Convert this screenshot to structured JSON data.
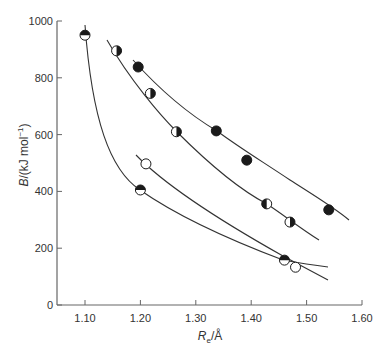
{
  "chart_data": {
    "type": "scatter",
    "title": "",
    "xlabel": "R_e/Å",
    "xlabel_main": "R",
    "xlabel_sub": "e",
    "xlabel_unit": "/Å",
    "ylabel": "B/(kJ mol⁻¹)",
    "ylabel_main": "B",
    "ylabel_unit": "/(kJ mol",
    "ylabel_sup": "−1",
    "ylabel_close": ")",
    "xlim": [
      1.05,
      1.6
    ],
    "ylim": [
      0,
      1000
    ],
    "xticks": [
      "1.10",
      "1.20",
      "1.30",
      "1.40",
      "1.50",
      "1.60"
    ],
    "yticks": [
      "0",
      "200",
      "400",
      "600",
      "800",
      "1000"
    ],
    "grid": false,
    "legend": null,
    "series": [
      {
        "name": "curve-a-steep",
        "points": [
          {
            "x": 1.1,
            "y": 950,
            "marker": "top-half-filled"
          },
          {
            "x": 1.2,
            "y": 405,
            "marker": "top-half-filled"
          },
          {
            "x": 1.46,
            "y": 158,
            "marker": "top-half-filled"
          }
        ],
        "curve_range": [
          1.1,
          1.55
        ]
      },
      {
        "name": "curve-b-open",
        "points": [
          {
            "x": 1.21,
            "y": 497,
            "marker": "open"
          },
          {
            "x": 1.48,
            "y": 133,
            "marker": "open"
          }
        ],
        "curve_range": [
          1.195,
          1.545
        ]
      },
      {
        "name": "curve-c-half",
        "points": [
          {
            "x": 1.157,
            "y": 895,
            "marker": "right-half-filled"
          },
          {
            "x": 1.218,
            "y": 745,
            "marker": "right-half-filled"
          },
          {
            "x": 1.265,
            "y": 610,
            "marker": "right-half-filled"
          },
          {
            "x": 1.428,
            "y": 356,
            "marker": "left-half-filled"
          },
          {
            "x": 1.47,
            "y": 292,
            "marker": "right-half-filled"
          }
        ],
        "curve_range": [
          1.145,
          1.51
        ]
      },
      {
        "name": "curve-d-filled",
        "points": [
          {
            "x": 1.196,
            "y": 838,
            "marker": "filled"
          },
          {
            "x": 1.337,
            "y": 613,
            "marker": "filled"
          },
          {
            "x": 1.392,
            "y": 510,
            "marker": "filled"
          },
          {
            "x": 1.54,
            "y": 335,
            "marker": "filled"
          }
        ],
        "curve_range": [
          1.185,
          1.575
        ]
      }
    ]
  },
  "colors": {
    "axis": "#666666",
    "curve": "#333333",
    "marker_fill": "#1a1a1a",
    "marker_open": "#ffffff"
  }
}
